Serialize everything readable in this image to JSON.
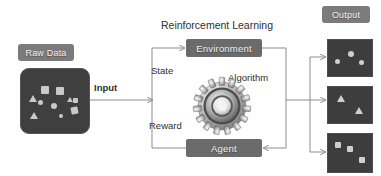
{
  "diagram": {
    "title": "Reinforcement Learning",
    "nodes": {
      "raw_data": "Raw Data",
      "environment": "Environment",
      "agent": "Agent",
      "output": "Output"
    },
    "edge_labels": {
      "input": "Input",
      "state": "State",
      "reward": "Reward",
      "algorithm": "Algorithm"
    },
    "icons": {
      "gear": "gear-icon"
    },
    "colors": {
      "chip_fill": "#7b7b7b",
      "node_fill": "#6b6b6b",
      "panel_fill": "#3f3f3f",
      "shape_fill": "#c9c9c9",
      "connector": "#8d8d8d",
      "text": "#2f2f2f",
      "chip_text": "#f2f2f2",
      "background": "#ffffff"
    },
    "raw_data_shapes": [
      {
        "type": "triangle",
        "x": 8,
        "y": 26
      },
      {
        "type": "square",
        "x": 20,
        "y": 17,
        "size": 8
      },
      {
        "type": "circle",
        "x": 17,
        "y": 31,
        "size": 5
      },
      {
        "type": "square",
        "x": 35,
        "y": 18,
        "size": 8
      },
      {
        "type": "circle",
        "x": 30,
        "y": 34,
        "size": 6
      },
      {
        "type": "triangle",
        "x": 9,
        "y": 43
      },
      {
        "type": "circle",
        "x": 38,
        "y": 45,
        "size": 4
      },
      {
        "type": "triangle",
        "x": 46,
        "y": 28
      },
      {
        "type": "square",
        "x": 52,
        "y": 29,
        "size": 5
      },
      {
        "type": "square",
        "x": 50,
        "y": 38,
        "size": 7
      }
    ],
    "output_panels": [
      {
        "name": "circles-panel",
        "shape": "circle",
        "shapes": [
          {
            "x": 7,
            "y": 19,
            "size": 5
          },
          {
            "x": 20,
            "y": 11,
            "size": 6
          },
          {
            "x": 31,
            "y": 20,
            "size": 5
          }
        ]
      },
      {
        "name": "triangles-panel",
        "shape": "triangle",
        "shapes": [
          {
            "x": 9,
            "y": 8
          },
          {
            "x": 28,
            "y": 21
          }
        ]
      },
      {
        "name": "squares-panel",
        "shape": "square",
        "shapes": [
          {
            "x": 7,
            "y": 8,
            "size": 6
          },
          {
            "x": 19,
            "y": 12,
            "size": 6
          },
          {
            "x": 31,
            "y": 23,
            "size": 6
          }
        ]
      }
    ]
  }
}
